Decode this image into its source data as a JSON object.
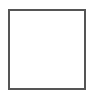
{
  "shape": {
    "type": "square-outline",
    "stroke_color": "#555555",
    "fill_color": "#ffffff"
  },
  "background_color": "#ffffff"
}
